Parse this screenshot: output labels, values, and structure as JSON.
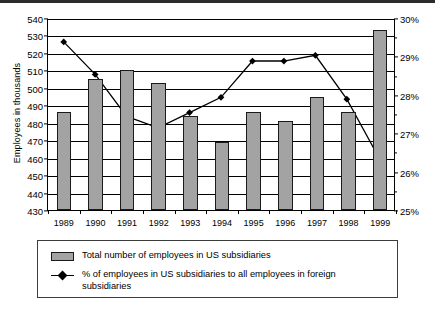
{
  "chart_data": {
    "type": "bar",
    "title": "",
    "subtitle": "",
    "xlabel": "",
    "ylabel": "Employees in thousands",
    "y2label": "",
    "categories": [
      "1989",
      "1990",
      "1991",
      "1992",
      "1993",
      "1994",
      "1995",
      "1996",
      "1997",
      "1998",
      "1999"
    ],
    "ylim": [
      430,
      540
    ],
    "ytick_step": 10,
    "yticks": [
      "540",
      "530",
      "520",
      "510",
      "500",
      "490",
      "480",
      "470",
      "460",
      "450",
      "440",
      "430"
    ],
    "y2lim": [
      25,
      30
    ],
    "y2tick_step": 1,
    "y2ticks": [
      "30%",
      "29%",
      "28%",
      "27%",
      "26%",
      "25%"
    ],
    "y2_minor_step": 0.5,
    "grid": true,
    "legend_position": "bottom",
    "series": [
      {
        "name": "Total number of employees in US subsidiaries",
        "type": "bar",
        "axis": "left",
        "unit": "thousands",
        "color": "#A3A3A3",
        "values": [
          486,
          505,
          510,
          503,
          484,
          469,
          486,
          481,
          495,
          486,
          533
        ]
      },
      {
        "name": "% of employees in US subsidiaries to all employees in foreign subsidiaries",
        "type": "line",
        "axis": "right",
        "unit": "%",
        "color": "#000000",
        "marker": "diamond",
        "values": [
          29.4,
          28.55,
          27.45,
          27.15,
          27.55,
          27.95,
          28.9,
          28.9,
          29.05,
          27.9,
          26.4
        ]
      }
    ]
  },
  "legend": {
    "items": [
      {
        "marker": "bar-swatch",
        "label": "Total number of employees in US subsidiaries"
      },
      {
        "marker": "line-diamond-swatch",
        "label": "% of employees in US subsidiaries to all employees in foreign subsidiaries"
      }
    ]
  }
}
